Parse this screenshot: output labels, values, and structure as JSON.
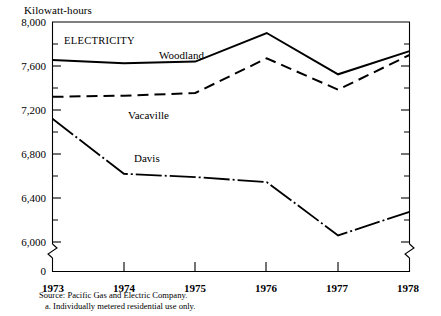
{
  "chart_data": {
    "type": "line",
    "title": "",
    "panel_label": "ELECTRICITY",
    "ylabel": "Kilowatt-hours",
    "xlabel": "",
    "x": [
      1973,
      1974,
      1975,
      1976,
      1977,
      1978
    ],
    "xticklabels": [
      "1973",
      "1974",
      "1975",
      "1976",
      "1977",
      "1978"
    ],
    "yticklabels": [
      "8,000",
      "7,600",
      "7,200",
      "6,800",
      "6,400",
      "6,000",
      "0"
    ],
    "ytickvalues": [
      8000,
      7600,
      7200,
      6800,
      6400,
      6000,
      0
    ],
    "minor_tick_interval": 200,
    "ylim": [
      5950,
      8000
    ],
    "y_axis_break": true,
    "grid": false,
    "legend_position": "inline-labels",
    "series": [
      {
        "name": "Woodland",
        "style": "solid",
        "values": [
          7655,
          7625,
          7640,
          7900,
          7525,
          7735
        ]
      },
      {
        "name": "Vacaville",
        "style": "dashed",
        "values": [
          7320,
          7330,
          7355,
          7670,
          7385,
          7700
        ]
      },
      {
        "name": "Davis",
        "style": "dash-dot",
        "values": [
          7120,
          6620,
          6590,
          6545,
          6060,
          6275
        ]
      }
    ],
    "notes": [
      "Source:  Pacific Gas and Electric Company.",
      "a.  Individually metered residential use only."
    ]
  }
}
